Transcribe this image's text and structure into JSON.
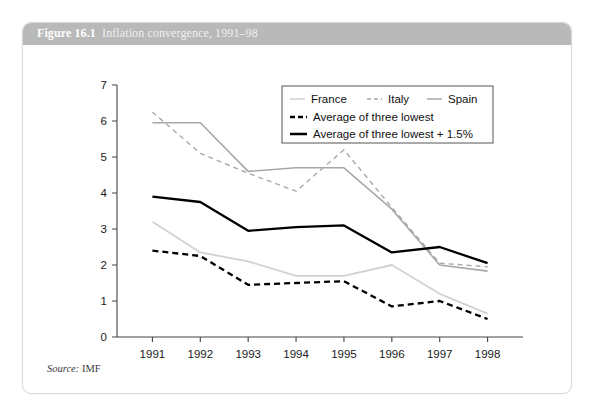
{
  "figure": {
    "number": "Figure 16.1",
    "caption": "Inflation convergence, 1991–98"
  },
  "source": {
    "label": "Source:",
    "value": "IMF"
  },
  "colors": {
    "header_band": "#b9b9b9",
    "card_border": "#d8d8d8",
    "france": "#d2d2d2",
    "italy": "#a8a8a8",
    "spain": "#a8a8a8",
    "avg_lowest": "#000000",
    "avg_lowest_plus": "#000000",
    "axis": "#444444"
  },
  "chart_data": {
    "type": "line",
    "title": "Inflation convergence, 1991–98",
    "xlabel": "",
    "ylabel": "",
    "x": [
      "1991",
      "1992",
      "1993",
      "1994",
      "1995",
      "1996",
      "1997",
      "1998"
    ],
    "categories": [
      "1991",
      "1992",
      "1993",
      "1994",
      "1995",
      "1996",
      "1997",
      "1998"
    ],
    "ylim": [
      0,
      7
    ],
    "yticks": [
      0,
      1,
      2,
      3,
      4,
      5,
      6,
      7
    ],
    "ytick_labels": [
      "0",
      "1",
      "2",
      "3",
      "4",
      "5",
      "6",
      "7"
    ],
    "grid": false,
    "legend_position": "top-right",
    "series": [
      {
        "name": "France",
        "style": "solid",
        "color": "#d2d2d2",
        "width": 1.8,
        "values": [
          3.2,
          2.35,
          2.1,
          1.7,
          1.7,
          2.0,
          1.2,
          0.65
        ]
      },
      {
        "name": "Italy",
        "style": "dashed",
        "color": "#a8a8a8",
        "width": 1.4,
        "values": [
          6.25,
          5.1,
          4.55,
          4.05,
          5.2,
          3.6,
          2.05,
          1.95
        ]
      },
      {
        "name": "Spain",
        "style": "solid",
        "color": "#a8a8a8",
        "width": 1.6,
        "values": [
          5.95,
          5.95,
          4.6,
          4.7,
          4.7,
          3.55,
          2.0,
          1.83
        ]
      },
      {
        "name": "Average of three lowest",
        "style": "dashed",
        "color": "#000000",
        "width": 2.3,
        "values": [
          2.4,
          2.25,
          1.45,
          1.5,
          1.55,
          0.85,
          1.0,
          0.5
        ]
      },
      {
        "name": "Average of three lowest + 1.5%",
        "style": "solid",
        "color": "#000000",
        "width": 2.3,
        "values": [
          3.9,
          3.75,
          2.95,
          3.05,
          3.1,
          2.35,
          2.5,
          2.05
        ]
      }
    ],
    "legend": [
      {
        "label": "France",
        "style": "solid",
        "color": "#d2d2d2",
        "row": 0
      },
      {
        "label": "Italy",
        "style": "dashed",
        "color": "#a8a8a8",
        "row": 0
      },
      {
        "label": "Spain",
        "style": "solid",
        "color": "#a8a8a8",
        "row": 0
      },
      {
        "label": "Average of three lowest",
        "style": "dashed",
        "color": "#000000",
        "row": 1
      },
      {
        "label": "Average of three lowest + 1.5%",
        "style": "solid",
        "color": "#000000",
        "row": 2
      }
    ]
  }
}
